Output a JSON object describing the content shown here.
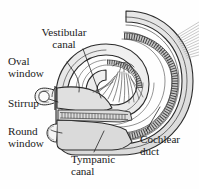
{
  "figure": {
    "background_color": "#fefefe",
    "ink_color": "#1a1a1a",
    "fill_color": "#e3e3e3",
    "fill_color_light": "#efefef",
    "fill_color_dark": "#cfcfcf"
  },
  "labels": {
    "vestibular_canal": "Vestibular\ncanal",
    "oval_window": "Oval\nwindow",
    "stirrup": "Stirrup",
    "round_window": "Round\nwindow",
    "tympanic_canal": "Tympanic\ncanal",
    "cochlear_duct": "Cochlear\nduct"
  },
  "structures": {
    "spiral_shell": "cochlea-spiral-shell",
    "vestibular_canal_chamber": "vestibular-canal-chamber",
    "tympanic_canal_chamber": "tympanic-canal-chamber",
    "cochlear_duct_band": "cochlear-duct-hatched-band",
    "basilar_membrane": "basilar-membrane-striped-band",
    "nerve_fibers": "auditory-nerve-fibers",
    "modiolus": "modiolus-central-core",
    "stirrup_bone": "stirrup-stapes-bone",
    "oval_window_opening": "oval-window-opening",
    "round_window_opening": "round-window-opening",
    "nerve_exit": "nerve-bundle-exit"
  },
  "leader_lines": {
    "vestibular_canal": "leader-vestibular-canal",
    "oval_window": "leader-oval-window",
    "stirrup": "leader-stirrup",
    "round_window": "leader-round-window",
    "tympanic_canal": "leader-tympanic-canal",
    "cochlear_duct": "leader-cochlear-duct"
  }
}
